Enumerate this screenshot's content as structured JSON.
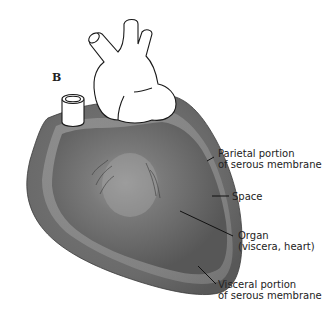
{
  "figure": {
    "panel_letter": "B",
    "labels": [
      {
        "id": "parietal",
        "line1": "Parietal portion",
        "line2": "of serous membrane"
      },
      {
        "id": "space",
        "line1": "Space"
      },
      {
        "id": "organ",
        "line1": "Organ",
        "line2": "(viscera, heart)"
      },
      {
        "id": "visceral",
        "line1": "Visceral portion",
        "line2": "of serous membrane"
      }
    ],
    "colors": {
      "outer_membrane": "#6e6e6e",
      "space_band": "#9a9a9a",
      "organ": "#5a5a5a",
      "organ_highlight": "#8a8a8a",
      "vessels": "#ffffff",
      "outline": "#1a1a1a"
    }
  }
}
